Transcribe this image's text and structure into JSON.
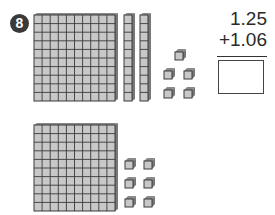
{
  "problem": {
    "number": "8",
    "addend1": "1.25",
    "addend2": "+1.06",
    "answer": ""
  },
  "blocks": {
    "top": {
      "hundreds_flats": 1,
      "tens_rods": 2,
      "ones_cubes": 5
    },
    "bottom": {
      "hundreds_flats": 1,
      "tens_rods": 0,
      "ones_cubes": 6
    }
  },
  "colors": {
    "block_fill": "#c8c8c8",
    "block_line": "#3a3a3a",
    "badge": "#3a3a3a"
  }
}
